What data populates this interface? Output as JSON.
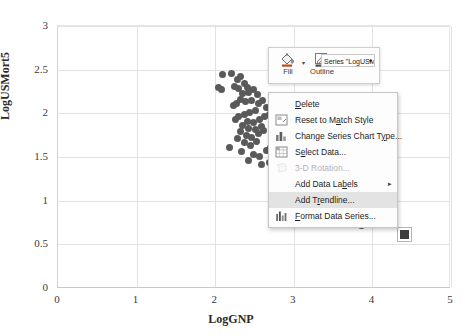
{
  "chart_data": {
    "type": "scatter",
    "title": "",
    "xlabel": "LogGNP",
    "ylabel": "LogUSMort5",
    "xlim": [
      0,
      5
    ],
    "ylim": [
      0,
      3
    ],
    "xticks": [
      "0",
      "1",
      "2",
      "3",
      "4",
      "5"
    ],
    "yticks": [
      "0",
      "0.5",
      "1",
      "1.5",
      "2",
      "2.5",
      "3"
    ],
    "grid": true,
    "legend": "none",
    "series_name": "LogUSMort5",
    "marker_color": "#5a5a5a",
    "points": [
      [
        2.1,
        2.43
      ],
      [
        2.22,
        2.45
      ],
      [
        2.3,
        2.38
      ],
      [
        2.33,
        2.41
      ],
      [
        2.05,
        2.28
      ],
      [
        2.09,
        2.26
      ],
      [
        2.26,
        2.3
      ],
      [
        2.31,
        2.27
      ],
      [
        2.38,
        2.33
      ],
      [
        2.42,
        2.29
      ],
      [
        2.36,
        2.21
      ],
      [
        2.44,
        2.23
      ],
      [
        2.5,
        2.26
      ],
      [
        2.55,
        2.2
      ],
      [
        2.47,
        2.14
      ],
      [
        2.4,
        2.12
      ],
      [
        2.34,
        2.15
      ],
      [
        2.29,
        2.1
      ],
      [
        2.24,
        2.08
      ],
      [
        2.56,
        2.1
      ],
      [
        2.62,
        2.13
      ],
      [
        2.66,
        2.05
      ],
      [
        2.52,
        2.02
      ],
      [
        2.45,
        2.0
      ],
      [
        2.38,
        1.98
      ],
      [
        2.31,
        1.95
      ],
      [
        2.27,
        1.92
      ],
      [
        2.43,
        1.9
      ],
      [
        2.5,
        1.88
      ],
      [
        2.58,
        1.92
      ],
      [
        2.64,
        1.95
      ],
      [
        2.7,
        1.98
      ],
      [
        2.36,
        1.85
      ],
      [
        2.44,
        1.82
      ],
      [
        2.53,
        1.8
      ],
      [
        2.6,
        1.84
      ],
      [
        2.33,
        1.78
      ],
      [
        2.41,
        1.74
      ],
      [
        2.48,
        1.71
      ],
      [
        2.56,
        1.76
      ],
      [
        2.63,
        1.79
      ],
      [
        2.3,
        1.7
      ],
      [
        2.38,
        1.66
      ],
      [
        2.46,
        1.62
      ],
      [
        2.54,
        1.67
      ],
      [
        2.2,
        1.6
      ],
      [
        2.35,
        1.55
      ],
      [
        2.5,
        1.52
      ],
      [
        2.58,
        1.49
      ],
      [
        2.66,
        1.56
      ],
      [
        2.72,
        1.6
      ],
      [
        2.44,
        1.45
      ],
      [
        2.6,
        1.4
      ],
      [
        2.7,
        1.43
      ],
      [
        2.78,
        1.38
      ],
      [
        3.88,
        0.7
      ]
    ],
    "selected_point": [
      4.42,
      0.6
    ]
  },
  "mini_toolbar": {
    "fill_label": "Fill",
    "fill_icon": "paint-bucket-icon",
    "outline_label": "Outline",
    "outline_icon": "pencil-outline-icon",
    "series_selector_value": "Series \"LogUSM",
    "caret": "▾"
  },
  "context_menu": {
    "items": [
      {
        "label": "Delete",
        "icon": "none",
        "accel": "D",
        "state": "normal",
        "submenu": false
      },
      {
        "label": "Reset to Match Style",
        "icon": "reset-style-icon",
        "accel": "a",
        "state": "normal",
        "submenu": false
      },
      {
        "label": "Change Series Chart Type...",
        "icon": "chart-type-icon",
        "accel": "y",
        "state": "normal",
        "submenu": false
      },
      {
        "label": "Select Data...",
        "icon": "select-data-icon",
        "accel": "e",
        "state": "normal",
        "submenu": false
      },
      {
        "label": "3-D Rotation...",
        "icon": "rotation-3d-icon",
        "accel": "",
        "state": "disabled",
        "submenu": false
      },
      {
        "label": "Add Data Labels",
        "icon": "none",
        "accel": "b",
        "state": "normal",
        "submenu": true
      },
      {
        "label": "Add Trendline...",
        "icon": "none",
        "accel": "r",
        "state": "highlighted",
        "submenu": false
      },
      {
        "label": "Format Data Series...",
        "icon": "format-series-icon",
        "accel": "F",
        "state": "normal",
        "submenu": false
      }
    ],
    "submenu_arrow": "▸"
  }
}
